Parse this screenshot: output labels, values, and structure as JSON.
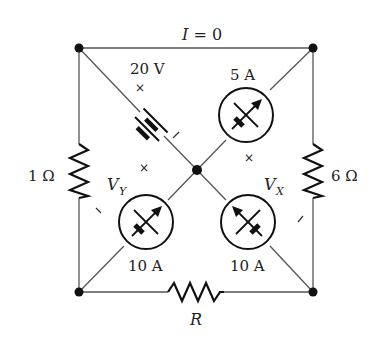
{
  "diagram": {
    "type": "circuit",
    "top_wire_label": {
      "italic": "I",
      "rest": " = 0"
    },
    "battery": {
      "label": "20 V"
    },
    "ammeter_top_right": {
      "label": "5 A"
    },
    "ammeter_bottom_left": {
      "label": "10 A",
      "voltage_symbol": "V",
      "voltage_subscript": "Y"
    },
    "ammeter_bottom_right": {
      "label": "10 A",
      "voltage_symbol": "V",
      "voltage_subscript": "X"
    },
    "resistor_left": {
      "label": "1 Ω"
    },
    "resistor_right": {
      "label": "6 Ω"
    },
    "resistor_bottom": {
      "label": "R"
    },
    "polarity_marks": {
      "plus": "×",
      "minus": "/"
    }
  }
}
